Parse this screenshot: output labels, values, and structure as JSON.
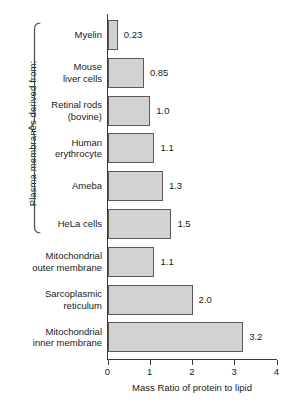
{
  "chart_data": {
    "type": "bar",
    "orientation": "horizontal",
    "title": "",
    "xlabel": "Mass Ratio of protein to lipid",
    "ylabel": "",
    "xlim": [
      0,
      4
    ],
    "xticks": [
      "0",
      "1",
      "2",
      "3",
      "4"
    ],
    "grid": false,
    "legend": "none",
    "categories": [
      "Myelin",
      "Mouse\nliver cells",
      "Retinal rods\n(bovine)",
      "Human\nerythrocyte",
      "Ameba",
      "HeLa cells",
      "Mitochondrial\nouter membrane",
      "Sarcoplasmic\nreticulum",
      "Mitochondrial\ninner membrane"
    ],
    "values": [
      0.23,
      0.85,
      1.0,
      1.1,
      1.3,
      1.5,
      1.1,
      2.0,
      3.2
    ],
    "value_labels": [
      "0.23",
      "0.85",
      "1.0",
      "1.1",
      "1.3",
      "1.5",
      "1.1",
      "2.0",
      "3.2"
    ],
    "bar_color": "#d2d2d2",
    "bar_edge_color": "#5a5a5a",
    "axis_color": "#3a3a3a"
  },
  "annotation": {
    "group_bracket_label": "Plasma membranes derived from:",
    "group_bracket_members": 6
  }
}
